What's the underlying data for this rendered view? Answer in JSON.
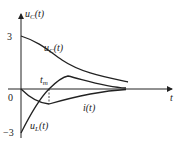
{
  "diagram": {
    "y_axis_label": "u",
    "y_axis_label_sub": "C",
    "y_axis_label_arg": "(t)",
    "x_axis_label": "t",
    "tick_top": "3",
    "tick_origin": "0",
    "tick_bottom": "−3",
    "curves": [
      {
        "name": "uC",
        "label": "u",
        "sub": "C",
        "arg": "(t)"
      },
      {
        "name": "i",
        "label": "i",
        "sub": "",
        "arg": "(t)"
      },
      {
        "name": "uL",
        "label": "u",
        "sub": "L",
        "arg": "(t)"
      }
    ],
    "marker_label": "t",
    "marker_sub": "m",
    "line_color": "#222222"
  }
}
